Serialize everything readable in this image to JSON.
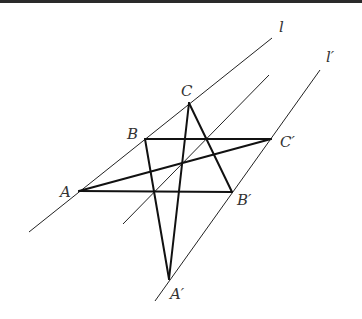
{
  "diagram": {
    "colors": {
      "thin_line": "#222222",
      "thick_line": "#111111",
      "label": "#333333",
      "top_bar": "#2a2a2a"
    },
    "lines": [
      {
        "id": "l",
        "label": "l",
        "x1": 29,
        "y1": 232,
        "x2": 272,
        "y2": 38,
        "label_x": 279,
        "label_y": 32
      },
      {
        "id": "middle",
        "label": "",
        "x1": 123,
        "y1": 224,
        "x2": 269,
        "y2": 75
      },
      {
        "id": "l_prime",
        "label": "l′",
        "x1": 155,
        "y1": 301,
        "x2": 320,
        "y2": 70,
        "label_x": 326,
        "label_y": 62
      }
    ],
    "points": {
      "A": {
        "label": "A",
        "x": 79,
        "y": 191,
        "lx": 60,
        "ly": 197
      },
      "B": {
        "label": "B",
        "x": 145,
        "y": 139,
        "lx": 127,
        "ly": 139
      },
      "C": {
        "label": "C",
        "x": 189,
        "y": 103,
        "lx": 181,
        "ly": 96
      },
      "A_prime": {
        "label": "A′",
        "x": 169,
        "y": 279,
        "lx": 170,
        "ly": 299
      },
      "B_prime": {
        "label": "B′",
        "x": 232,
        "y": 192,
        "lx": 237,
        "ly": 205
      },
      "C_prime": {
        "label": "C′",
        "x": 271,
        "y": 139,
        "lx": 280,
        "ly": 147
      }
    },
    "segments": [
      [
        "B",
        "C_prime"
      ],
      [
        "A",
        "B_prime"
      ],
      [
        "A",
        "C_prime"
      ],
      [
        "C",
        "A_prime"
      ],
      [
        "B",
        "A_prime"
      ],
      [
        "C",
        "B_prime"
      ]
    ]
  }
}
